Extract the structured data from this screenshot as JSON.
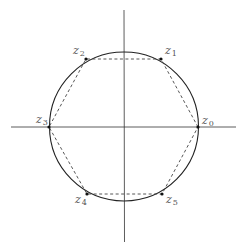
{
  "diagram": {
    "title": "",
    "colors": {
      "stroke": "#222222",
      "axis": "#333333",
      "label": "#555555",
      "background": "#ffffff"
    },
    "vertices": [
      {
        "base": "z",
        "sub": "0"
      },
      {
        "base": "z",
        "sub": "1"
      },
      {
        "base": "z",
        "sub": "2"
      },
      {
        "base": "z",
        "sub": "3"
      },
      {
        "base": "z",
        "sub": "4"
      },
      {
        "base": "z",
        "sub": "5"
      }
    ]
  }
}
